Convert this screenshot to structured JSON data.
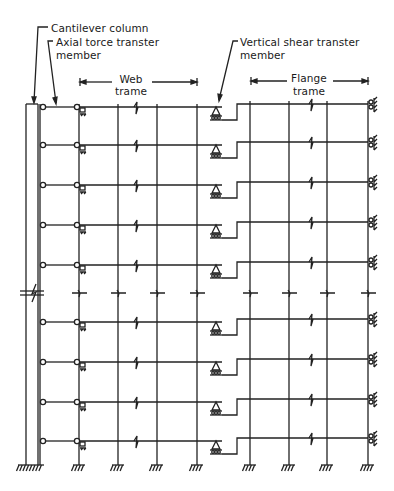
{
  "diagram": {
    "type": "structural-frame-model",
    "labels": {
      "cantilever_column": "Cantilever column",
      "axial_force_member_line1": "Axial torce transter",
      "axial_force_member_line2": "member",
      "vertical_shear_member_line1": "Vertical shear transter",
      "vertical_shear_member_line2": "member",
      "web_frame_line1": "Web",
      "web_frame_line2": "trame",
      "flange_frame_line1": "Flange",
      "flange_frame_line2": "trame"
    },
    "components": [
      "cantilever column",
      "axial force transfer member",
      "web frame",
      "vertical shear transfer member",
      "flange frame"
    ],
    "web_frame_columns": 4,
    "flange_frame_columns": 4,
    "floors_shown": 9,
    "upper_floors": 5,
    "lower_floors": 4,
    "height_break": true,
    "colors": {
      "ink": "#222222",
      "background": "#ffffff"
    }
  }
}
